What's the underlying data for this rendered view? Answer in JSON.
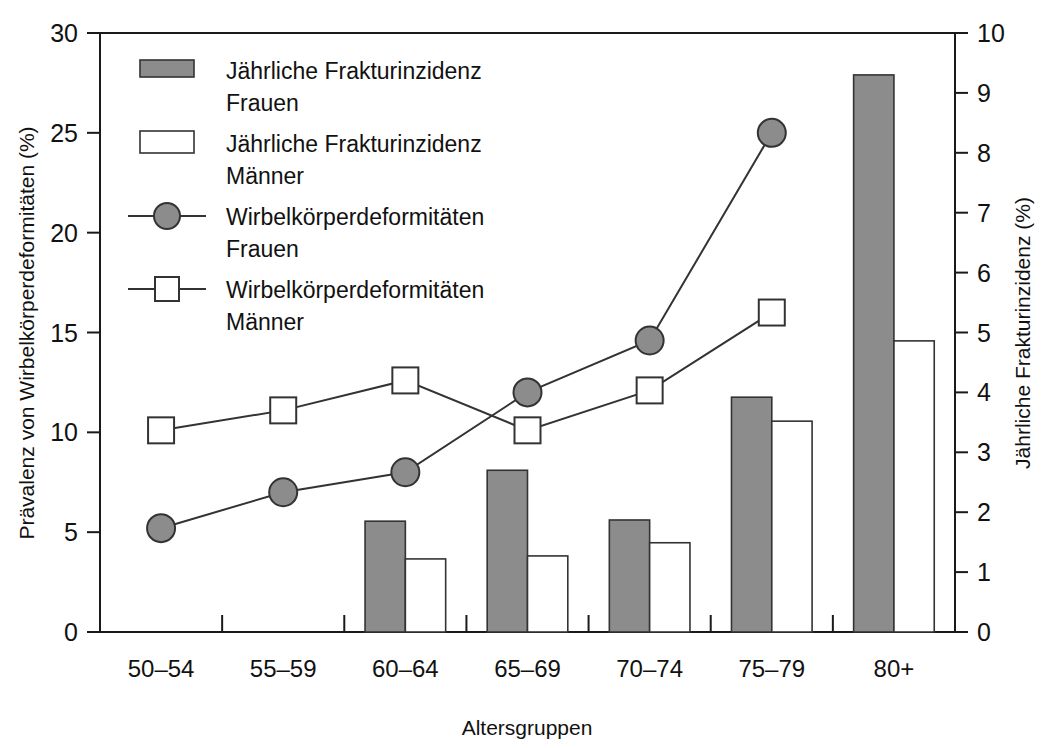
{
  "chart_data": {
    "type": "bar",
    "title": "",
    "subtitle": "",
    "xlabel": "Altersgruppen",
    "ylabel": "Prävalenz von Wirbelkörperdeformitäten (%)",
    "y2label": "Jährliche Frakturinzidenz (%)",
    "categories": [
      "50–54",
      "55–59",
      "60–64",
      "65–69",
      "70–74",
      "75–79",
      "80+"
    ],
    "ylim": [
      0,
      30
    ],
    "yticks": [
      "0",
      "5",
      "10",
      "15",
      "20",
      "25",
      "30"
    ],
    "ytick_values": [
      0,
      5,
      10,
      15,
      20,
      25,
      30
    ],
    "y2lim": [
      0,
      10
    ],
    "y2ticks": [
      "0",
      "1",
      "2",
      "3",
      "4",
      "5",
      "6",
      "7",
      "8",
      "9",
      "10"
    ],
    "y2tick_values": [
      0,
      1,
      2,
      3,
      4,
      5,
      6,
      7,
      8,
      9,
      10
    ],
    "grid": false,
    "legend_position": "upper-left-inside",
    "series": [
      {
        "name": "Jährliche Frakturinzidenz Frauen",
        "type": "bar",
        "axis": "right",
        "color": "#8c8c8c",
        "edge": "#333333",
        "values": [
          null,
          null,
          1.85,
          2.7,
          1.87,
          3.92,
          9.3
        ]
      },
      {
        "name": "Jährliche Frakturinzidenz Männer",
        "type": "bar",
        "axis": "right",
        "color": "#ffffff",
        "edge": "#333333",
        "values": [
          null,
          null,
          1.22,
          1.27,
          1.49,
          3.52,
          4.86
        ]
      },
      {
        "name": "Wirbelkörperdeformitäten Frauen",
        "type": "line",
        "axis": "left",
        "marker": "circle",
        "color": "#8c8c8c",
        "edge": "#333333",
        "values": [
          5.2,
          7.0,
          8.0,
          12.0,
          14.6,
          25.0,
          null
        ]
      },
      {
        "name": "Wirbelkörperdeformitäten Männer",
        "type": "line",
        "axis": "left",
        "marker": "square",
        "color": "#ffffff",
        "edge": "#333333",
        "values": [
          10.1,
          11.1,
          12.6,
          10.1,
          12.1,
          16.0,
          null
        ]
      }
    ]
  },
  "legend": {
    "items": [
      {
        "label_line1": "Jährliche Frakturinzidenz",
        "label_line2": "Frauen",
        "swatch": "filled-bar"
      },
      {
        "label_line1": "Jährliche Frakturinzidenz",
        "label_line2": "Männer",
        "swatch": "open-bar"
      },
      {
        "label_line1": "Wirbelkörperdeformitäten",
        "label_line2": "Frauen",
        "swatch": "filled-circle-line"
      },
      {
        "label_line1": "Wirbelkörperdeformitäten",
        "label_line2": "Männer",
        "swatch": "open-square-line"
      }
    ]
  },
  "colors": {
    "fill_gray": "#8c8c8c",
    "fill_white": "#ffffff",
    "stroke": "#333333",
    "axis": "#1a1a1a",
    "text": "#111111"
  }
}
